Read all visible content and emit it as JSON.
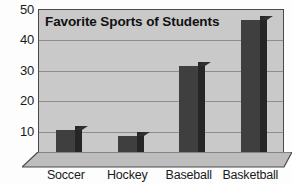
{
  "chart_data": {
    "type": "bar",
    "title": "Favorite Sports of Students",
    "categories": [
      "Soccer",
      "Hockey",
      "Baseball",
      "Basketball"
    ],
    "values": [
      10,
      8,
      31,
      46
    ],
    "xlabel": "",
    "ylabel": "",
    "ylim": [
      0,
      50
    ],
    "yticks": [
      10,
      20,
      30,
      40,
      50
    ],
    "ytick_labels": [
      "10",
      "20",
      "30",
      "40",
      "50"
    ],
    "grid": true,
    "legend": false,
    "style": "3d-column",
    "colors": {
      "bar_front": "#3f3f3f",
      "bar_side": "#262626",
      "plot_background": "#c9c9c9",
      "gridline": "#8e8e8e",
      "frame": "#4a4a4a",
      "page_background": "#fdfdfd",
      "text": "#1a1a1a"
    }
  }
}
